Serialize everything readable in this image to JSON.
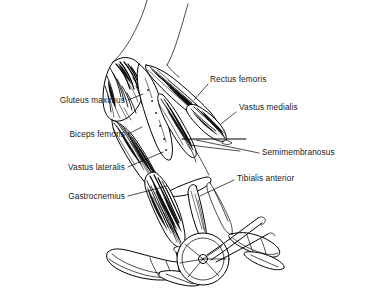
{
  "figure": {
    "background_color": "#ffffff",
    "ink_color": "#000000",
    "text_color": "#1a1a1a",
    "style": "black and white line drawing with hatched muscle shading",
    "width": 373,
    "height": 290
  },
  "labels": {
    "left": [
      {
        "id": "gluteus-maximus",
        "text": "Gluteus maximus",
        "x": 125,
        "y": 103
      },
      {
        "id": "biceps-femoris",
        "text": "Biceps femoris",
        "x": 125,
        "y": 137
      },
      {
        "id": "vastus-lateralis",
        "text": "Vastus lateralis",
        "x": 125,
        "y": 170
      },
      {
        "id": "gastrocnemius",
        "text": "Gastrocnemius",
        "x": 125,
        "y": 199
      }
    ],
    "right": [
      {
        "id": "rectus-femoris",
        "text": "Rectus femoris",
        "x": 210,
        "y": 82
      },
      {
        "id": "vastus-medialis",
        "text": "Vastus medialis",
        "x": 239,
        "y": 110
      },
      {
        "id": "semimembranosus",
        "text": "Semimembranosus",
        "x": 262,
        "y": 155
      },
      {
        "id": "tibialis-anterior",
        "text": "Tibialis anterior",
        "x": 237,
        "y": 181
      }
    ]
  },
  "structures": [
    {
      "id": "gluteus-maximus",
      "region": "hip / buttock",
      "shading": "dense dark striations"
    },
    {
      "id": "biceps-femoris",
      "region": "posterior thigh",
      "shading": "dense dark striations"
    },
    {
      "id": "rectus-femoris",
      "region": "anterior thigh",
      "shading": "fine parallel striations"
    },
    {
      "id": "vastus-medialis",
      "region": "anterior medial thigh",
      "shading": "fine parallel striations"
    },
    {
      "id": "vastus-lateralis",
      "region": "anterior lateral thigh",
      "shading": "fine parallel striations"
    },
    {
      "id": "semimembranosus",
      "region": "posterior medial thigh",
      "shading": "fine parallel striations"
    },
    {
      "id": "gastrocnemius",
      "region": "posterior calf",
      "shading": "dense dark striations"
    },
    {
      "id": "tibialis-anterior",
      "region": "anterior shin",
      "shading": "light outline"
    },
    {
      "id": "femur",
      "region": "thigh bone",
      "shading": "white unshaded"
    },
    {
      "id": "shoe-near",
      "region": "foot on near pedal",
      "shading": "outline only"
    },
    {
      "id": "shoe-far",
      "region": "foot on far pedal",
      "shading": "outline only"
    },
    {
      "id": "pedal-crank",
      "region": "bicycle pedal and crank",
      "shading": "outline only"
    }
  ]
}
